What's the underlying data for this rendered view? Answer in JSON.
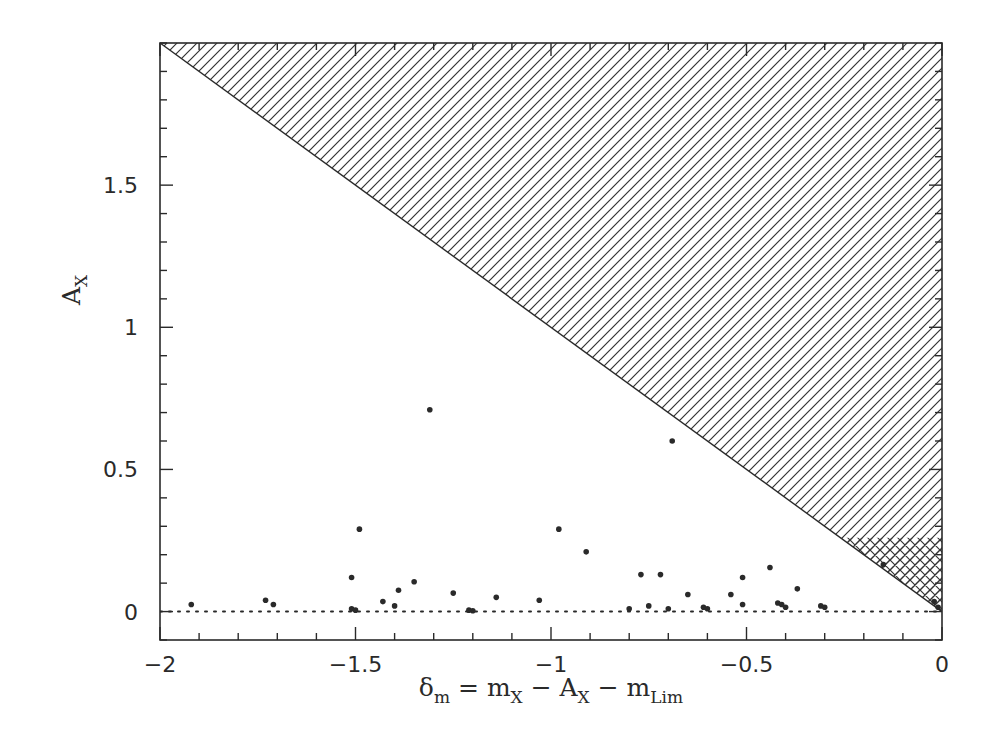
{
  "chart_data": {
    "type": "scatter",
    "title": "",
    "xlabel": "δm = mX − AX − mLim",
    "ylabel": "AX",
    "xlabel_parts": {
      "delta": "δ",
      "delta_sub": "m",
      "eq": " = m",
      "mx_sub": "X",
      "minus1": " − A",
      "ax_sub": "X",
      "minus2": " − m",
      "mlim_sub": "Lim"
    },
    "ylabel_parts": {
      "main": "A",
      "sub": "X"
    },
    "xlim": [
      -2,
      0
    ],
    "ylim": [
      -0.1,
      2.0
    ],
    "x_ticks": [
      {
        "value": -2,
        "label": "−2"
      },
      {
        "value": -1.5,
        "label": "−1.5"
      },
      {
        "value": -1,
        "label": "−1"
      },
      {
        "value": -0.5,
        "label": "−0.5"
      },
      {
        "value": 0,
        "label": "0"
      }
    ],
    "y_ticks": [
      {
        "value": 0,
        "label": "0"
      },
      {
        "value": 0.5,
        "label": "0.5"
      },
      {
        "value": 1,
        "label": "1"
      },
      {
        "value": 1.5,
        "label": "1.5"
      }
    ],
    "x_minor_step": 0.1,
    "y_minor_step": 0.1,
    "grid": false,
    "legend": null,
    "annotations": [
      {
        "type": "hatched-region",
        "description": "excluded region above line AX = −δm (diagonal hatch)",
        "polygon": [
          [
            -2,
            2.0
          ],
          [
            0,
            2.0
          ],
          [
            0,
            0
          ]
        ]
      },
      {
        "type": "crosshatched-region",
        "description": "cross-hatched region near origin, AX between line and 0.26",
        "polygon": [
          [
            -0.26,
            0.26
          ],
          [
            0,
            0.26
          ],
          [
            0,
            0
          ]
        ]
      },
      {
        "type": "reference-line",
        "style": "dotted",
        "y": 0
      }
    ],
    "series": [
      {
        "name": "sources",
        "marker": "dot",
        "points": [
          [
            -1.92,
            0.025
          ],
          [
            -1.73,
            0.04
          ],
          [
            -1.71,
            0.025
          ],
          [
            -1.51,
            0.12
          ],
          [
            -1.51,
            0.01
          ],
          [
            -1.5,
            0.005
          ],
          [
            -1.49,
            0.29
          ],
          [
            -1.43,
            0.035
          ],
          [
            -1.4,
            0.02
          ],
          [
            -1.39,
            0.075
          ],
          [
            -1.35,
            0.105
          ],
          [
            -1.31,
            0.71
          ],
          [
            -1.25,
            0.065
          ],
          [
            -1.21,
            0.005
          ],
          [
            -1.2,
            0.003
          ],
          [
            -1.14,
            0.05
          ],
          [
            -1.03,
            0.04
          ],
          [
            -0.98,
            0.29
          ],
          [
            -0.91,
            0.21
          ],
          [
            -0.8,
            0.01
          ],
          [
            -0.77,
            0.13
          ],
          [
            -0.75,
            0.02
          ],
          [
            -0.72,
            0.13
          ],
          [
            -0.7,
            0.01
          ],
          [
            -0.69,
            0.6
          ],
          [
            -0.65,
            0.06
          ],
          [
            -0.61,
            0.015
          ],
          [
            -0.6,
            0.01
          ],
          [
            -0.54,
            0.06
          ],
          [
            -0.51,
            0.12
          ],
          [
            -0.51,
            0.025
          ],
          [
            -0.44,
            0.155
          ],
          [
            -0.42,
            0.03
          ],
          [
            -0.41,
            0.025
          ],
          [
            -0.4,
            0.015
          ],
          [
            -0.37,
            0.08
          ],
          [
            -0.31,
            0.02
          ],
          [
            -0.3,
            0.015
          ],
          [
            -0.15,
            0.165
          ],
          [
            -0.02,
            0.035
          ],
          [
            -0.01,
            0.015
          ]
        ]
      }
    ]
  },
  "colors": {
    "ink": "#2a2a2a",
    "background": "#ffffff"
  }
}
